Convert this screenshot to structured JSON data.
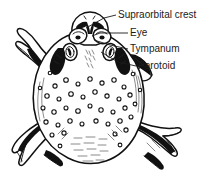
{
  "figure": {
    "view": "dorsal",
    "background_color": "#ffffff",
    "ink_color": "#111111",
    "label_color": "#1a1a1a"
  },
  "labels": [
    {
      "id": "supraorbital-crest",
      "text": "Supraorbital crest",
      "text_x": 118,
      "text_y": 15,
      "leader": "M 116,15 L 104,18 L 86,28",
      "anchor_x": 86,
      "anchor_y": 28
    },
    {
      "id": "eye",
      "text": "Eye",
      "text_x": 130,
      "text_y": 33,
      "leader": "M 128,33 L 100,33 L 92,36",
      "anchor_x": 92,
      "anchor_y": 36
    },
    {
      "id": "tympanum",
      "text": "Tympanum",
      "text_x": 130,
      "text_y": 49,
      "leader": "M 128,49 L 110,45 L 94,40",
      "anchor_x": 94,
      "anchor_y": 40
    },
    {
      "id": "parotoid",
      "text": "Parotoid",
      "text_x": 138,
      "text_y": 66,
      "leader": "M 136,66 L 118,62 L 101,52",
      "anchor_x": 101,
      "anchor_y": 52
    }
  ],
  "anatomy": {
    "body_outline_name": "toad-body-outline",
    "head_name": "toad-head",
    "eyes": [
      "left-eye",
      "right-eye"
    ],
    "parotoid_glands": [
      "left-parotoid-gland",
      "right-parotoid-gland"
    ],
    "limbs": [
      "left-forelimb",
      "right-forelimb",
      "left-hindlimb",
      "right-hindlimb"
    ],
    "skin_texture": "warty-dorsal-skin"
  }
}
